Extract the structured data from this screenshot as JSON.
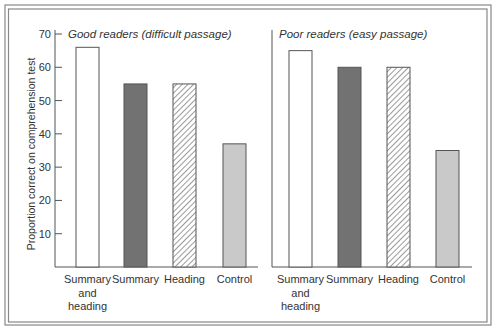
{
  "chart_data": {
    "type": "bar",
    "ylabel": "Proportion correct on comprehension test",
    "ylim": [
      0,
      70
    ],
    "yticks": [
      10,
      20,
      30,
      40,
      50,
      60,
      70
    ],
    "grid": false,
    "categories": [
      [
        "Summary",
        "and",
        "heading"
      ],
      [
        "Summary"
      ],
      [
        "Heading"
      ],
      [
        "Control"
      ]
    ],
    "bar_styles": [
      {
        "name": "Summary and heading",
        "fill": "#ffffff",
        "pattern": "none"
      },
      {
        "name": "Summary",
        "fill": "#727272",
        "pattern": "none"
      },
      {
        "name": "Heading",
        "fill": "#ffffff",
        "pattern": "hatch"
      },
      {
        "name": "Control",
        "fill": "#c9c9c9",
        "pattern": "none"
      }
    ],
    "panels": [
      {
        "title": "Good readers (difficult passage)",
        "values": [
          66,
          55,
          55,
          37
        ]
      },
      {
        "title": "Poor readers (easy passage)",
        "values": [
          65,
          60,
          60,
          35
        ]
      }
    ]
  }
}
